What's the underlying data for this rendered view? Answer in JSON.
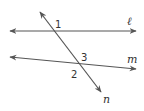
{
  "diagram": {
    "type": "parallel lines cut by a transversal",
    "stroke_color": "#555555",
    "lines": [
      {
        "name": "ℓ",
        "label": "ℓ",
        "from": [
          10,
          31
        ],
        "to": [
          136,
          31
        ]
      },
      {
        "name": "m",
        "label": "m",
        "from": [
          10,
          57
        ],
        "to": [
          136,
          69
        ]
      },
      {
        "name": "n",
        "label": "n",
        "from": [
          40,
          12
        ],
        "to": [
          101,
          92
        ]
      }
    ],
    "angles": [
      {
        "label": "1",
        "position": [
          57,
          27
        ]
      },
      {
        "label": "3",
        "position": [
          83,
          60
        ]
      },
      {
        "label": "2",
        "position": [
          73,
          77
        ]
      }
    ],
    "line_labels": {
      "l": "ℓ",
      "m": "m",
      "n": "n"
    }
  }
}
